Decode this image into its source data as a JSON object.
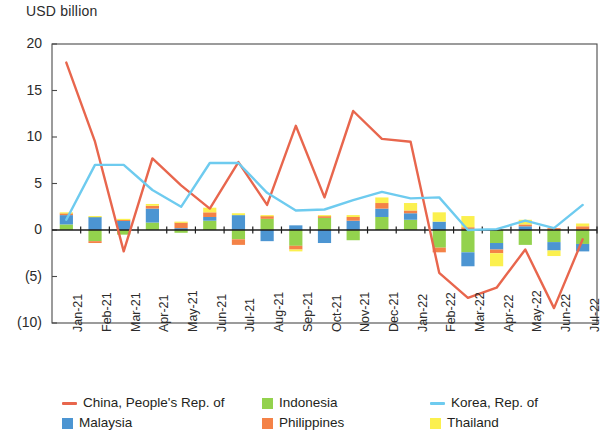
{
  "chart": {
    "axis_unit_label": "USD billion",
    "y_ticks": [
      "20",
      "15",
      "10",
      "5",
      "0",
      "(5)",
      "(10)"
    ]
  },
  "legend": {
    "items": [
      {
        "label": "China, People's Rep. of",
        "color": "#e8664d",
        "marker": "line",
        "name": "legend-china"
      },
      {
        "label": "Indonesia",
        "color": "#93d24d",
        "marker": "box",
        "name": "legend-indonesia"
      },
      {
        "label": "Korea, Rep. of",
        "color": "#6ecbef",
        "marker": "line",
        "name": "legend-korea"
      },
      {
        "label": "Malaysia",
        "color": "#4c95d2",
        "marker": "box",
        "name": "legend-malaysia"
      },
      {
        "label": "Philippines",
        "color": "#f48247",
        "marker": "box",
        "name": "legend-philippines"
      },
      {
        "label": "Thailand",
        "color": "#fbf04e",
        "marker": "box",
        "name": "legend-thailand"
      }
    ]
  },
  "chart_data": {
    "type": "bar",
    "title": "",
    "subtitle": "",
    "xlabel": "",
    "ylabel": "USD billion",
    "ylim": [
      -10,
      20
    ],
    "yticks": [
      -10,
      -5,
      0,
      5,
      10,
      15,
      20
    ],
    "ytick_labels": [
      "(10)",
      "(5)",
      "0",
      "5",
      "10",
      "15",
      "20"
    ],
    "grid": false,
    "legend_position": "bottom",
    "stacked": true,
    "categories": [
      "Jan-21",
      "Feb-21",
      "Mar-21",
      "Apr-21",
      "May-21",
      "Jun-21",
      "Jul-21",
      "Aug-21",
      "Sep-21",
      "Oct-21",
      "Nov-21",
      "Dec-21",
      "Jan-22",
      "Feb-22",
      "Mar-22",
      "Apr-22",
      "May-22",
      "Jun-22",
      "Jul-22"
    ],
    "bar_series": [
      {
        "name": "Indonesia",
        "color": "#93d24d",
        "values": [
          0.6,
          -1.2,
          -0.5,
          0.8,
          -0.3,
          1.0,
          -1.0,
          1.2,
          -1.7,
          1.3,
          -1.1,
          1.4,
          1.1,
          -1.9,
          -2.4,
          -1.4,
          -1.6,
          -1.3,
          -1.5
        ]
      },
      {
        "name": "Malaysia",
        "color": "#4c95d2",
        "values": [
          1.0,
          1.4,
          1.0,
          1.5,
          0.2,
          0.4,
          1.6,
          -1.2,
          0.5,
          -1.4,
          1.0,
          0.9,
          0.7,
          0.9,
          -1.5,
          -0.7,
          0.4,
          -0.9,
          -0.8
        ]
      },
      {
        "name": "Philippines",
        "color": "#f48247",
        "values": [
          0.2,
          -0.2,
          0.1,
          0.3,
          0.6,
          0.5,
          -0.6,
          0.3,
          -0.4,
          0.2,
          0.4,
          0.6,
          0.3,
          -0.5,
          0.3,
          -0.4,
          0.2,
          0.2,
          0.4
        ]
      },
      {
        "name": "Thailand",
        "color": "#fbf04e",
        "values": [
          0.1,
          0.1,
          0.1,
          0.2,
          0.1,
          0.5,
          0.2,
          0.1,
          -0.2,
          0.1,
          0.2,
          0.6,
          0.8,
          1.0,
          1.2,
          -1.4,
          0.5,
          -0.6,
          0.3
        ]
      }
    ],
    "line_series": [
      {
        "name": "China, People's Rep. of",
        "color": "#e8664d",
        "values": [
          18.0,
          9.5,
          -2.3,
          7.7,
          4.8,
          2.3,
          7.3,
          2.7,
          11.2,
          3.5,
          12.8,
          9.8,
          9.5,
          -4.6,
          -7.3,
          -6.2,
          -2.1,
          -8.4,
          -1.0
        ]
      },
      {
        "name": "Korea, Rep. of",
        "color": "#6ecbef",
        "values": [
          1.1,
          7.0,
          7.0,
          4.3,
          2.5,
          7.2,
          7.2,
          4.0,
          2.1,
          2.2,
          3.2,
          4.1,
          3.4,
          3.5,
          0.0,
          0.1,
          1.0,
          0.2,
          2.7
        ]
      }
    ]
  }
}
